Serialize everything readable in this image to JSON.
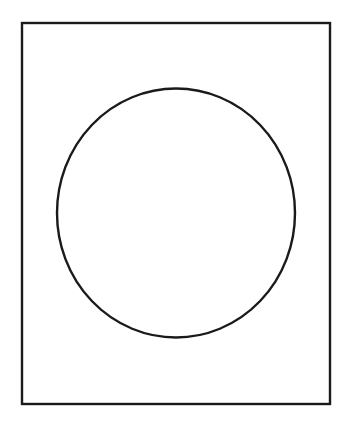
{
  "artwork": {
    "title": "Circle in a rectangular frame",
    "background_color": "#ffffff",
    "stroke_color": "#1a1a1a",
    "canvas": {
      "width": 350,
      "height": 425
    },
    "shapes": [
      {
        "name": "outer-frame",
        "type": "rectangle",
        "x": 22,
        "y": 23,
        "width": 308,
        "height": 381,
        "stroke_color": "#1a1a1a",
        "stroke_width": 2.4,
        "fill": "none"
      },
      {
        "name": "inner-circle",
        "type": "ellipse",
        "cx": 176,
        "cy": 213,
        "rx": 119,
        "ry": 124.5,
        "stroke_color": "#1a1a1a",
        "stroke_width": 2.4,
        "fill": "none"
      }
    ]
  }
}
